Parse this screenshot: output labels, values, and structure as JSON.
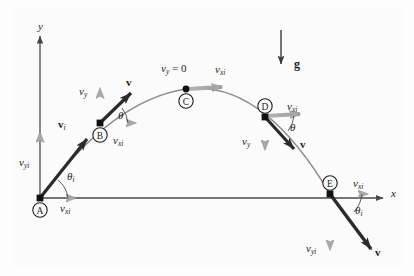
{
  "figure": {
    "background_color": "#fdfdfd",
    "panel_color": "#fbfbfb"
  },
  "colors": {
    "axis": "#4a4a4a",
    "trajectory": "#8a8a8a",
    "component_arrow": "#a9a9a9",
    "velocity_vector": "#2b2b2b",
    "gravity_vector": "#3a3a3a",
    "point_marker": "#111111",
    "text": "#1c1c1c"
  },
  "axes": {
    "y_label": "y",
    "x_label": "x"
  },
  "gravity": {
    "label": "g",
    "direction": "down"
  },
  "points": [
    {
      "id": "A",
      "marker_label": "A",
      "x": 40,
      "y": 198,
      "description": "launch point at origin"
    },
    {
      "id": "B",
      "marker_label": "B",
      "x": 100,
      "y": 123,
      "description": "ascending point"
    },
    {
      "id": "C",
      "marker_label": "C",
      "x": 186,
      "y": 89,
      "description": "apex, peak of trajectory"
    },
    {
      "id": "D",
      "marker_label": "D",
      "x": 265,
      "y": 117,
      "description": "descending point"
    },
    {
      "id": "E",
      "marker_label": "E",
      "x": 330,
      "y": 194,
      "description": "landing level point"
    }
  ],
  "labels": {
    "y_axis": "y",
    "x_axis": "x",
    "gravity": "g",
    "apex_vy": "v",
    "apex_vy_sub": "y",
    "apex_vy_eq": " = 0",
    "v_initial": "v",
    "v_initial_sub": "i",
    "v_generic": "v",
    "v_xi": "v",
    "v_xi_sub": "xi",
    "v_yi": "v",
    "v_yi_sub": "yi",
    "v_y": "v",
    "v_y_sub": "y",
    "theta": "θ",
    "theta_i": "θ",
    "theta_i_sub": "i"
  },
  "annotations": [
    {
      "name": "y-axis-label",
      "text": "y",
      "x": 41,
      "y": 27
    },
    {
      "name": "x-axis-label",
      "text": "x",
      "x": 391,
      "y": 188
    },
    {
      "name": "gravity-label",
      "text": "g",
      "x": 295,
      "y": 64
    },
    {
      "name": "apex-vy-zero-label",
      "text": "vy = 0",
      "x": 162,
      "y": 69
    },
    {
      "name": "apex-vxi-label",
      "text": "vxi",
      "x": 216,
      "y": 70
    },
    {
      "name": "a-vyi-label",
      "text": "vyi",
      "x": 21,
      "y": 162
    },
    {
      "name": "a-vxi-label",
      "text": "vxi",
      "x": 61,
      "y": 208
    },
    {
      "name": "a-theta-i-label",
      "text": "θi",
      "x": 68,
      "y": 176
    },
    {
      "name": "a-vi-label",
      "text": "vi",
      "x": 60,
      "y": 123
    },
    {
      "name": "b-vy-label",
      "text": "vy",
      "x": 80,
      "y": 91
    },
    {
      "name": "b-v-label",
      "text": "v",
      "x": 126,
      "y": 81
    },
    {
      "name": "b-theta-label",
      "text": "θ",
      "x": 118,
      "y": 114
    },
    {
      "name": "b-vxi-label",
      "text": "vxi",
      "x": 114,
      "y": 140
    },
    {
      "name": "d-vxi-label",
      "text": "vxi",
      "x": 288,
      "y": 107
    },
    {
      "name": "d-vy-label",
      "text": "vy",
      "x": 243,
      "y": 141
    },
    {
      "name": "d-theta-label",
      "text": "θ",
      "x": 290,
      "y": 127
    },
    {
      "name": "d-v-label",
      "text": "v",
      "x": 300,
      "y": 143
    },
    {
      "name": "e-vxi-label",
      "text": "vxi",
      "x": 354,
      "y": 183
    },
    {
      "name": "e-theta-i-label",
      "text": "θi",
      "x": 355,
      "y": 210
    },
    {
      "name": "e-vyi-label",
      "text": "vyi",
      "x": 307,
      "y": 248
    },
    {
      "name": "e-v-label",
      "text": "v",
      "x": 374,
      "y": 251
    }
  ]
}
